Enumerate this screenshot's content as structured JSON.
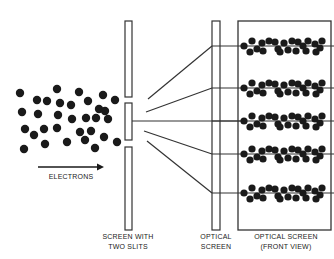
{
  "colors": {
    "ink": "#1a1a1a",
    "line": "#333333",
    "background": "#ffffff"
  },
  "labels": {
    "electrons": "ELECTRONS",
    "slit_screen_line1": "SCREEN WITH",
    "slit_screen_line2": "TWO SLITS",
    "optical_screen_line1": "OPTICAL",
    "optical_screen_line2": "SCREEN",
    "front_view_line1": "OPTICAL SCREEN",
    "front_view_line2": "(FRONT VIEW)"
  },
  "electron_source": {
    "dot_radius": 4.2,
    "dots": [
      [
        20,
        93
      ],
      [
        47,
        101
      ],
      [
        57,
        89
      ],
      [
        79,
        92
      ],
      [
        103,
        95
      ],
      [
        37,
        100
      ],
      [
        60,
        103
      ],
      [
        71,
        105
      ],
      [
        88,
        101
      ],
      [
        99,
        109
      ],
      [
        115,
        100
      ],
      [
        22,
        112
      ],
      [
        38,
        114
      ],
      [
        58,
        115
      ],
      [
        72,
        119
      ],
      [
        86,
        118
      ],
      [
        96,
        118
      ],
      [
        108,
        119
      ],
      [
        105,
        111
      ],
      [
        25,
        129
      ],
      [
        34,
        135
      ],
      [
        44,
        129
      ],
      [
        57,
        128
      ],
      [
        80,
        132
      ],
      [
        91,
        131
      ],
      [
        85,
        140
      ],
      [
        104,
        137
      ],
      [
        117,
        142
      ],
      [
        24,
        149
      ],
      [
        45,
        144
      ],
      [
        67,
        142
      ],
      [
        95,
        148
      ]
    ]
  },
  "slit_screen": {
    "x": 125,
    "width": 7,
    "segments": [
      [
        21,
        97
      ],
      [
        103,
        140
      ],
      [
        147,
        230
      ]
    ]
  },
  "rays": [
    {
      "from": [
        148,
        99
      ],
      "to": [
        212,
        46
      ]
    },
    {
      "from": [
        146,
        112
      ],
      "to": [
        212,
        88
      ]
    },
    {
      "from": [
        132,
        121
      ],
      "to": [
        245,
        121
      ]
    },
    {
      "from": [
        144,
        131
      ],
      "to": [
        212,
        154
      ]
    },
    {
      "from": [
        147,
        141
      ],
      "to": [
        212,
        193
      ]
    }
  ],
  "optical_screen": {
    "x": 212,
    "y": 21,
    "width": 8,
    "height": 209
  },
  "front_view": {
    "x": 238,
    "y": 21,
    "width": 93,
    "height": 209,
    "band_rows_y": [
      46,
      88,
      121,
      154,
      193
    ],
    "band_dot_offsets": [
      [
        6,
        0
      ],
      [
        14,
        -5
      ],
      [
        19,
        3
      ],
      [
        24,
        -3
      ],
      [
        31,
        -5
      ],
      [
        37,
        -4
      ],
      [
        40,
        3
      ],
      [
        46,
        -3
      ],
      [
        50,
        4
      ],
      [
        54,
        -5
      ],
      [
        60,
        -4
      ],
      [
        65,
        0
      ],
      [
        70,
        -5
      ],
      [
        77,
        -2
      ],
      [
        82,
        2
      ],
      [
        84,
        -5
      ],
      [
        12,
        6
      ],
      [
        25,
        5
      ],
      [
        42,
        6
      ],
      [
        58,
        5
      ],
      [
        68,
        5
      ],
      [
        78,
        6
      ]
    ],
    "band_line_extends_to": 334
  }
}
